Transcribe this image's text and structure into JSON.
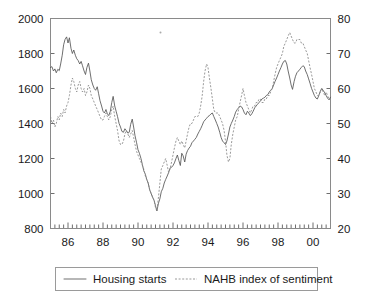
{
  "chart_data": {
    "type": "line",
    "title": "",
    "subtitle": "",
    "xlabel": "",
    "ylabel": "Housing starts",
    "y2label": "NAHB index of sentiment",
    "grid": false,
    "legend_position": "bottom",
    "xlim": [
      1985.0,
      2001.0
    ],
    "ylim": [
      800,
      2000
    ],
    "y2lim": [
      20,
      80
    ],
    "yticks": [
      800,
      1000,
      1200,
      1400,
      1600,
      1800,
      2000
    ],
    "ytick_labels": [
      "800",
      "1000",
      "1200",
      "1400",
      "1600",
      "1800",
      "2000"
    ],
    "y2ticks": [
      20,
      30,
      40,
      50,
      60,
      70,
      80
    ],
    "y2tick_labels": [
      "20",
      "30",
      "40",
      "50",
      "60",
      "70",
      "80"
    ],
    "xticks": [
      1986,
      1988,
      1990,
      1992,
      1994,
      1996,
      1998,
      2000
    ],
    "xtick_labels": [
      "86",
      "88",
      "90",
      "92",
      "94",
      "96",
      "98",
      "00"
    ],
    "xminor_interval": 0.25,
    "series": [
      {
        "name": "Housing starts",
        "axis": "left",
        "style": "solid",
        "color": "#555555",
        "x": [
          1985.0,
          1985.08,
          1985.17,
          1985.25,
          1985.33,
          1985.42,
          1985.5,
          1985.58,
          1985.67,
          1985.75,
          1985.83,
          1985.92,
          1986.0,
          1986.08,
          1986.17,
          1986.25,
          1986.33,
          1986.42,
          1986.5,
          1986.58,
          1986.67,
          1986.75,
          1986.83,
          1986.92,
          1987.0,
          1987.08,
          1987.17,
          1987.25,
          1987.33,
          1987.42,
          1987.5,
          1987.58,
          1987.67,
          1987.75,
          1987.83,
          1987.92,
          1988.0,
          1988.08,
          1988.17,
          1988.25,
          1988.33,
          1988.42,
          1988.5,
          1988.58,
          1988.67,
          1988.75,
          1988.83,
          1988.92,
          1989.0,
          1989.08,
          1989.17,
          1989.25,
          1989.33,
          1989.42,
          1989.5,
          1989.58,
          1989.67,
          1989.75,
          1989.83,
          1989.92,
          1990.0,
          1990.08,
          1990.17,
          1990.25,
          1990.33,
          1990.42,
          1990.5,
          1990.58,
          1990.67,
          1990.75,
          1990.83,
          1990.92,
          1991.0,
          1991.08,
          1991.17,
          1991.25,
          1991.33,
          1991.42,
          1991.5,
          1991.58,
          1991.67,
          1991.75,
          1991.83,
          1991.92,
          1992.0,
          1992.08,
          1992.17,
          1992.25,
          1992.33,
          1992.42,
          1992.5,
          1992.58,
          1992.67,
          1992.75,
          1992.83,
          1992.92,
          1993.0,
          1993.08,
          1993.17,
          1993.25,
          1993.33,
          1993.42,
          1993.5,
          1993.58,
          1993.67,
          1993.75,
          1993.83,
          1993.92,
          1994.0,
          1994.08,
          1994.17,
          1994.25,
          1994.33,
          1994.42,
          1994.5,
          1994.58,
          1994.67,
          1994.75,
          1994.83,
          1994.92,
          1995.0,
          1995.08,
          1995.17,
          1995.25,
          1995.33,
          1995.42,
          1995.5,
          1995.58,
          1995.67,
          1995.75,
          1995.83,
          1995.92,
          1996.0,
          1996.08,
          1996.17,
          1996.25,
          1996.33,
          1996.42,
          1996.5,
          1996.58,
          1996.67,
          1996.75,
          1996.83,
          1996.92,
          1997.0,
          1997.08,
          1997.17,
          1997.25,
          1997.33,
          1997.42,
          1997.5,
          1997.58,
          1997.67,
          1997.75,
          1997.83,
          1997.92,
          1998.0,
          1998.08,
          1998.17,
          1998.25,
          1998.33,
          1998.42,
          1998.5,
          1998.58,
          1998.67,
          1998.75,
          1998.83,
          1998.92,
          1999.0,
          1999.08,
          1999.17,
          1999.25,
          1999.33,
          1999.42,
          1999.5,
          1999.58,
          1999.67,
          1999.75,
          1999.83,
          1999.92,
          2000.0,
          2000.08,
          2000.17,
          2000.25,
          2000.33,
          2000.42,
          2000.5,
          2000.58,
          2000.67,
          2000.75,
          2000.83,
          2000.92,
          2001.0
        ],
        "values": [
          1720,
          1725,
          1700,
          1712,
          1690,
          1710,
          1702,
          1740,
          1790,
          1850,
          1880,
          1895,
          1860,
          1890,
          1830,
          1800,
          1820,
          1790,
          1770,
          1760,
          1740,
          1755,
          1730,
          1700,
          1680,
          1720,
          1745,
          1700,
          1650,
          1620,
          1600,
          1590,
          1610,
          1570,
          1530,
          1500,
          1470,
          1460,
          1480,
          1455,
          1445,
          1470,
          1520,
          1555,
          1500,
          1470,
          1440,
          1400,
          1380,
          1355,
          1350,
          1370,
          1360,
          1345,
          1350,
          1395,
          1425,
          1380,
          1330,
          1290,
          1250,
          1230,
          1200,
          1165,
          1130,
          1110,
          1080,
          1060,
          1020,
          1000,
          980,
          960,
          930,
          900,
          945,
          970,
          1010,
          1030,
          1060,
          1080,
          1100,
          1120,
          1145,
          1150,
          1160,
          1175,
          1200,
          1220,
          1190,
          1160,
          1230,
          1215,
          1180,
          1225,
          1245,
          1260,
          1270,
          1290,
          1300,
          1310,
          1320,
          1340,
          1355,
          1370,
          1390,
          1410,
          1420,
          1430,
          1440,
          1445,
          1455,
          1460,
          1440,
          1420,
          1400,
          1380,
          1350,
          1320,
          1300,
          1290,
          1280,
          1300,
          1340,
          1380,
          1400,
          1420,
          1440,
          1465,
          1480,
          1490,
          1500,
          1495,
          1480,
          1460,
          1450,
          1470,
          1460,
          1445,
          1455,
          1470,
          1490,
          1500,
          1510,
          1520,
          1530,
          1540,
          1545,
          1550,
          1560,
          1565,
          1580,
          1590,
          1600,
          1620,
          1640,
          1660,
          1680,
          1700,
          1720,
          1740,
          1755,
          1760,
          1740,
          1700,
          1660,
          1620,
          1595,
          1640,
          1670,
          1690,
          1700,
          1710,
          1720,
          1730,
          1725,
          1700,
          1680,
          1655,
          1630,
          1600,
          1580,
          1560,
          1545,
          1540,
          1560,
          1585,
          1600,
          1590,
          1575,
          1560,
          1545,
          1535,
          1550
        ]
      },
      {
        "name": "NAHB index of sentiment",
        "axis": "right",
        "style": "dotted",
        "color": "#888888",
        "x": [
          1985.0,
          1985.08,
          1985.17,
          1985.25,
          1985.33,
          1985.42,
          1985.5,
          1985.58,
          1985.67,
          1985.75,
          1985.83,
          1985.92,
          1986.0,
          1986.08,
          1986.17,
          1986.25,
          1986.33,
          1986.42,
          1986.5,
          1986.58,
          1986.67,
          1986.75,
          1986.83,
          1986.92,
          1987.0,
          1987.08,
          1987.17,
          1987.25,
          1987.33,
          1987.42,
          1987.5,
          1987.58,
          1987.67,
          1987.75,
          1987.83,
          1987.92,
          1988.0,
          1988.08,
          1988.17,
          1988.25,
          1988.33,
          1988.42,
          1988.5,
          1988.58,
          1988.67,
          1988.75,
          1988.83,
          1988.92,
          1989.0,
          1989.08,
          1989.17,
          1989.25,
          1989.33,
          1989.42,
          1989.5,
          1989.58,
          1989.67,
          1989.75,
          1989.83,
          1989.92,
          1990.0,
          1990.08,
          1990.17,
          1990.25,
          1990.33,
          1990.42,
          1990.5,
          1990.58,
          1990.67,
          1990.75,
          1990.83,
          1990.92,
          1991.0,
          1991.08,
          1991.17,
          1991.25,
          1991.33,
          1991.42,
          1991.5,
          1991.58,
          1991.67,
          1991.75,
          1991.83,
          1991.92,
          1992.0,
          1992.08,
          1992.17,
          1992.25,
          1992.33,
          1992.42,
          1992.5,
          1992.58,
          1992.67,
          1992.75,
          1992.83,
          1992.92,
          1993.0,
          1993.08,
          1993.17,
          1993.25,
          1993.33,
          1993.42,
          1993.5,
          1993.58,
          1993.67,
          1993.75,
          1993.83,
          1993.92,
          1994.0,
          1994.08,
          1994.17,
          1994.25,
          1994.33,
          1994.42,
          1994.5,
          1994.58,
          1994.67,
          1994.75,
          1994.83,
          1994.92,
          1995.0,
          1995.08,
          1995.17,
          1995.25,
          1995.33,
          1995.42,
          1995.5,
          1995.58,
          1995.67,
          1995.75,
          1995.83,
          1995.92,
          1996.0,
          1996.08,
          1996.17,
          1996.25,
          1996.33,
          1996.42,
          1996.5,
          1996.58,
          1996.67,
          1996.75,
          1996.83,
          1996.92,
          1997.0,
          1997.08,
          1997.17,
          1997.25,
          1997.33,
          1997.42,
          1997.5,
          1997.58,
          1997.67,
          1997.75,
          1997.83,
          1997.92,
          1998.0,
          1998.08,
          1998.17,
          1998.25,
          1998.33,
          1998.42,
          1998.5,
          1998.58,
          1998.67,
          1998.75,
          1998.83,
          1998.92,
          1999.0,
          1999.08,
          1999.17,
          1999.25,
          1999.33,
          1999.42,
          1999.5,
          1999.58,
          1999.67,
          1999.75,
          1999.83,
          1999.92,
          2000.0,
          2000.08,
          2000.17,
          2000.25,
          2000.33,
          2000.42,
          2000.5,
          2000.58,
          2000.67,
          2000.75,
          2000.83,
          2000.92,
          2001.0
        ],
        "values": [
          52,
          50,
          51,
          49,
          50,
          52,
          51,
          53,
          52,
          54,
          53,
          55,
          56,
          58,
          61,
          63,
          62,
          60,
          59,
          61,
          62,
          60,
          59,
          60,
          58,
          59,
          61,
          60,
          58,
          57,
          56,
          55,
          54,
          53,
          52,
          51,
          51,
          52,
          53,
          52,
          51,
          52,
          54,
          55,
          52,
          50,
          48,
          45,
          44,
          44,
          45,
          47,
          48,
          47,
          46,
          47,
          48,
          46,
          44,
          42,
          41,
          40,
          39,
          38,
          37,
          35,
          34,
          33,
          31,
          30,
          29,
          28,
          26,
          25,
          29,
          33,
          37,
          38,
          39,
          40,
          38,
          36,
          37,
          39,
          41,
          43,
          45,
          46,
          45,
          44,
          45,
          44,
          43,
          45,
          47,
          49,
          50,
          50,
          51,
          52,
          52,
          52,
          53,
          55,
          58,
          62,
          65,
          67,
          66,
          63,
          60,
          57,
          54,
          53,
          53,
          53,
          52,
          51,
          50,
          48,
          45,
          41,
          39,
          40,
          44,
          47,
          49,
          51,
          52,
          54,
          56,
          58,
          60,
          58,
          56,
          55,
          54,
          53,
          54,
          55,
          55,
          56,
          56,
          57,
          57,
          56,
          56,
          57,
          57,
          58,
          58,
          59,
          60,
          62,
          64,
          66,
          67,
          68,
          69,
          70,
          72,
          73,
          74,
          75,
          76,
          75,
          74,
          73,
          73,
          74,
          74,
          74,
          73,
          73,
          72,
          71,
          70,
          68,
          66,
          64,
          62,
          60,
          59,
          58,
          58,
          59,
          60,
          59,
          58,
          59,
          58,
          57,
          57
        ]
      }
    ],
    "legend": [
      {
        "label": "Housing starts",
        "style": "solid"
      },
      {
        "label": "NAHB index of sentiment",
        "style": "dotted"
      }
    ]
  }
}
